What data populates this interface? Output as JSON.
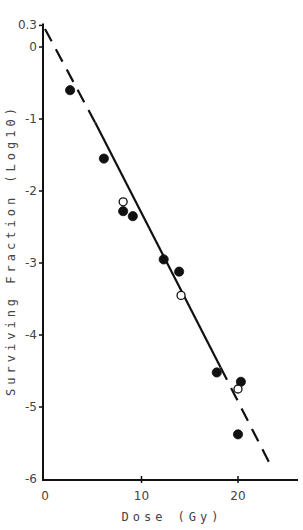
{
  "chart_data": {
    "type": "scatter",
    "title": "",
    "xlabel": "Dose (Gy)",
    "ylabel": "Surviving Fraction (Log10)",
    "xlim": [
      0,
      26
    ],
    "ylim": [
      -6,
      0.3
    ],
    "x_ticks": [
      0,
      10,
      20
    ],
    "x_tick_labels": [
      "0",
      "10",
      "20"
    ],
    "y_ticks": [
      0.3,
      0,
      -1,
      -2,
      -3,
      -4,
      -5,
      -6
    ],
    "y_tick_labels": [
      "0.3",
      "0",
      "-1",
      "-2",
      "-3",
      "-4",
      "-5",
      "-6"
    ],
    "grid": false,
    "legend": null,
    "series": [
      {
        "name": "filled circles",
        "marker": "filled-circle",
        "points": [
          {
            "x": 2.6,
            "y": -0.6
          },
          {
            "x": 6.1,
            "y": -1.55
          },
          {
            "x": 8.1,
            "y": -2.28
          },
          {
            "x": 9.1,
            "y": -2.35
          },
          {
            "x": 12.3,
            "y": -2.95
          },
          {
            "x": 13.9,
            "y": -3.12
          },
          {
            "x": 17.8,
            "y": -4.52
          },
          {
            "x": 20.3,
            "y": -4.65
          },
          {
            "x": 20.0,
            "y": -5.38
          }
        ]
      },
      {
        "name": "open circles",
        "marker": "open-circle",
        "points": [
          {
            "x": 8.1,
            "y": -2.15
          },
          {
            "x": 14.1,
            "y": -3.45
          },
          {
            "x": 20.0,
            "y": -4.75
          }
        ]
      }
    ],
    "fit_line": {
      "name": "linear fit",
      "solid_segment": {
        "x0": 5.2,
        "y0": -1.05,
        "x1": 18.2,
        "y1": -4.45
      },
      "dashed_extensions": [
        {
          "x0": 0.0,
          "y0": 0.25,
          "x1": 5.2,
          "y1": -1.05
        },
        {
          "x0": 18.2,
          "y0": -4.45,
          "x1": 23.6,
          "y1": -5.87
        }
      ]
    }
  }
}
